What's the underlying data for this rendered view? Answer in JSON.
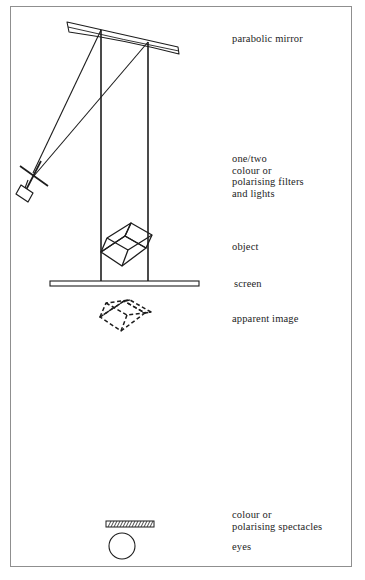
{
  "figure": {
    "background_color": "#ffffff",
    "frame_color": "#8f8f8f",
    "ink_color": "#1d1d1d"
  },
  "labels": {
    "parabolic_mirror": "parabolic mirror",
    "filters_and_lights": "one/two\ncolour or\npolarising filters\nand lights",
    "object": "object",
    "screen": "screen",
    "apparent_image": "apparent image",
    "spectacles": "colour or\npolarising spectacles",
    "eyes": "eyes"
  },
  "parts": {
    "parabolic_mirror": "curved sliver mirror tilted, top of diagram",
    "light_source": "small rectangular lamp with cross-shaped filter at left",
    "ray_1": "ray from lamp to left end of mirror",
    "ray_2": "ray from lamp to right portion of mirror",
    "vertical_support_left": "vertical line from mirror down to screen",
    "vertical_support_right": "vertical line from mirror down to screen",
    "object_cube": "solid wireframe cube above the screen",
    "screen_bar": "horizontal flat screen bar",
    "apparent_image_cube": "dashed wireframe cube below the screen",
    "spectacles_bar": "hatched rectangular spectacles",
    "eye_circle": "circle representing the eyes"
  }
}
